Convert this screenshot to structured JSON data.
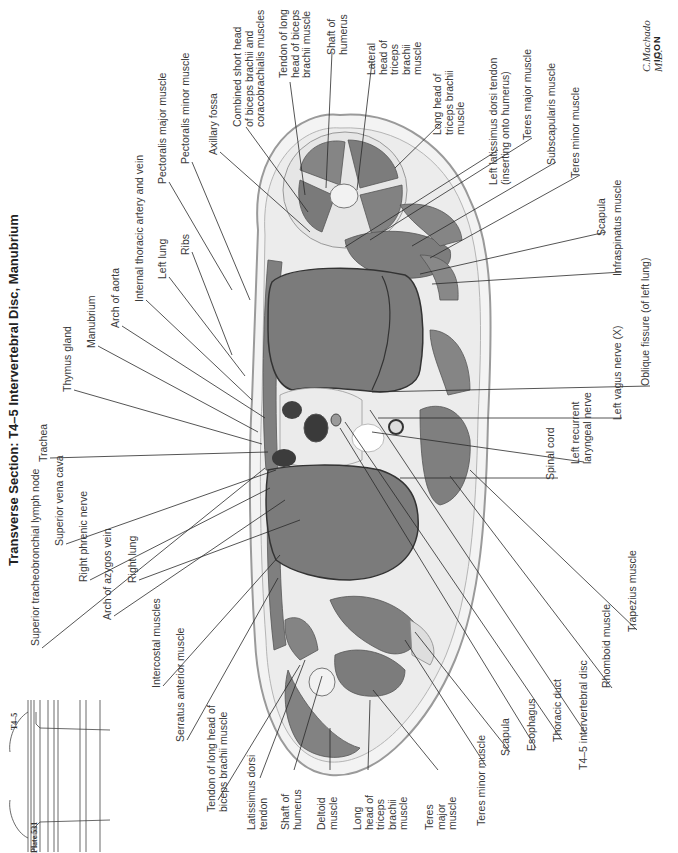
{
  "page": {
    "title": "Transverse Section: T4–5 Intervertebral Disc, Manubrium",
    "plate_number": "Plate 531",
    "level_marker": "T4–5",
    "signature": "C.Machado M.D.",
    "logo": "ICON"
  },
  "labels_left": [
    {
      "id": "trachea",
      "text": "Trachea",
      "x": 38,
      "y": 462
    },
    {
      "id": "thymus-gland",
      "text": "Thymus gland",
      "x": 62,
      "y": 392
    },
    {
      "id": "manubrium",
      "text": "Manubrium",
      "x": 86,
      "y": 348
    },
    {
      "id": "arch-of-aorta",
      "text": "Arch of aorta",
      "x": 110,
      "y": 328
    },
    {
      "id": "internal-thoracic-artery-and-vein",
      "text": "Internal thoracic artery and vein",
      "x": 134,
      "y": 302
    },
    {
      "id": "left-lung",
      "text": "Left lung",
      "x": 157,
      "y": 279
    },
    {
      "id": "ribs",
      "text": "Ribs",
      "x": 180,
      "y": 255
    },
    {
      "id": "pectoralis-major-muscle",
      "text": "Pectoralis major muscle",
      "x": 157,
      "y": 184
    },
    {
      "id": "pectoralis-minor-muscle",
      "text": "Pectoralis minor muscle",
      "x": 180,
      "y": 164
    },
    {
      "id": "axillary-fossa",
      "text": "Axillary fossa",
      "x": 208,
      "y": 155
    },
    {
      "id": "combined-short-head",
      "text": "Combined short head\nof biceps brachii and\ncoracobrachialis muscles",
      "x": 232,
      "y": 127
    },
    {
      "id": "tendon-long-head-biceps-top",
      "text": "Tendon of long\nhead of biceps\nbrachii muscle",
      "x": 278,
      "y": 78
    },
    {
      "id": "shaft-of-humerus-top",
      "text": "Shaft of\nhumerus",
      "x": 326,
      "y": 55
    },
    {
      "id": "lateral-head-triceps",
      "text": "Lateral\nhead of\ntriceps\nbrachii\nmuscle",
      "x": 366,
      "y": 75
    },
    {
      "id": "long-head-triceps-top",
      "text": "Long head of\ntriceps brachii\nmuscle",
      "x": 432,
      "y": 135
    },
    {
      "id": "left-latissimus-dorsi-tendon",
      "text": "Left latissimus dorsi tendon\n(inserting onto humerus)",
      "x": 488,
      "y": 185
    },
    {
      "id": "teres-major-muscle-top",
      "text": "Teres major muscle",
      "x": 522,
      "y": 140
    },
    {
      "id": "subscapularis-muscle",
      "text": "Subscapularis muscle",
      "x": 546,
      "y": 165
    },
    {
      "id": "teres-minor-muscle-top",
      "text": "Teres minor muscle",
      "x": 570,
      "y": 178
    },
    {
      "id": "scapula-top",
      "text": "Scapula",
      "x": 596,
      "y": 236
    },
    {
      "id": "infraspinatus-muscle",
      "text": "Infraspinatus muscle",
      "x": 612,
      "y": 276
    },
    {
      "id": "oblique-fissure",
      "text": "Oblique fissure (of left lung)",
      "x": 640,
      "y": 386
    },
    {
      "id": "left-vagus-nerve",
      "text": "Left vagus nerve (X)",
      "x": 612,
      "y": 420
    },
    {
      "id": "left-recurrent-laryngeal-nerve",
      "text": "Left recurrent\nlaryngeal nerve",
      "x": 570,
      "y": 464
    },
    {
      "id": "spinal-cord",
      "text": "Spinal cord",
      "x": 545,
      "y": 480
    }
  ],
  "labels_bottom": [
    {
      "id": "superior-tracheobronchial-lymph-node",
      "text": "Superior tracheobronchial lymph node",
      "x": 30,
      "y": 646
    },
    {
      "id": "superior-vena-cava",
      "text": "Superior vena cava",
      "x": 54,
      "y": 546
    },
    {
      "id": "right-phrenic-nerve",
      "text": "Right phrenic nerve",
      "x": 78,
      "y": 582
    },
    {
      "id": "arch-of-azygos-vein",
      "text": "Arch of azygos vein",
      "x": 102,
      "y": 620
    },
    {
      "id": "right-lung",
      "text": "Right lung",
      "x": 127,
      "y": 583
    },
    {
      "id": "intercostal-muscles",
      "text": "Intercostal muscles",
      "x": 151,
      "y": 688
    },
    {
      "id": "serratus-anterior-muscle",
      "text": "Serratus anterior muscle",
      "x": 175,
      "y": 742
    },
    {
      "id": "tendon-long-head-biceps-bottom",
      "text": "Tendon of long head of\nbiceps brachii muscle",
      "x": 206,
      "y": 812
    },
    {
      "id": "latissimus-dorsi-tendon",
      "text": "Latissimus dorsi\ntendon",
      "x": 246,
      "y": 830
    },
    {
      "id": "shaft-of-humerus-bottom",
      "text": "Shaft of\nhumerus",
      "x": 280,
      "y": 830
    },
    {
      "id": "deltoid-muscle",
      "text": "Deltoid\nmuscle",
      "x": 316,
      "y": 830
    },
    {
      "id": "long-head-triceps-bottom",
      "text": "Long\nhead of\ntriceps\nbrachii\nmuscle",
      "x": 352,
      "y": 830
    },
    {
      "id": "teres-major-muscle-bottom",
      "text": "Teres\nmajor\nmuscle",
      "x": 424,
      "y": 830
    },
    {
      "id": "teres-minor-muscle-bottom",
      "text": "Teres minor muscle",
      "x": 476,
      "y": 826
    },
    {
      "id": "scapula-bottom",
      "text": "Scapula",
      "x": 500,
      "y": 756
    },
    {
      "id": "esophagus",
      "text": "Esophagus",
      "x": 526,
      "y": 751
    },
    {
      "id": "thoracic-duct",
      "text": "Thoracic duct",
      "x": 552,
      "y": 742
    },
    {
      "id": "t4-5-intervertebral-disc",
      "text": "T4–5 intervertebral disc",
      "x": 578,
      "y": 770
    },
    {
      "id": "rhomboid-muscle",
      "text": "Rhomboid muscle",
      "x": 601,
      "y": 688
    },
    {
      "id": "trapezius-muscle",
      "text": "Trapezius muscle",
      "x": 627,
      "y": 632
    }
  ],
  "leader_lines": [
    [
      50,
      458,
      268,
      452
    ],
    [
      74,
      390,
      262,
      444
    ],
    [
      98,
      346,
      258,
      432
    ],
    [
      122,
      326,
      265,
      418
    ],
    [
      146,
      300,
      252,
      400
    ],
    [
      169,
      277,
      245,
      376
    ],
    [
      192,
      252,
      232,
      355
    ],
    [
      169,
      182,
      232,
      290
    ],
    [
      192,
      162,
      250,
      300
    ],
    [
      220,
      152,
      310,
      232
    ],
    [
      246,
      127,
      308,
      212
    ],
    [
      290,
      82,
      305,
      195
    ],
    [
      332,
      52,
      326,
      188
    ],
    [
      372,
      62,
      357,
      190
    ],
    [
      442,
      122,
      395,
      168
    ],
    [
      498,
      150,
      345,
      247
    ],
    [
      532,
      138,
      370,
      240
    ],
    [
      556,
      162,
      412,
      246
    ],
    [
      580,
      175,
      430,
      258
    ],
    [
      606,
      232,
      420,
      274
    ],
    [
      622,
      272,
      432,
      284
    ],
    [
      650,
      386,
      372,
      392
    ],
    [
      622,
      418,
      378,
      418
    ],
    [
      584,
      462,
      372,
      432
    ],
    [
      558,
      478,
      400,
      478
    ],
    [
      42,
      648,
      265,
      468
    ],
    [
      66,
      544,
      276,
      470
    ],
    [
      90,
      580,
      270,
      488
    ],
    [
      114,
      616,
      285,
      500
    ],
    [
      139,
      580,
      300,
      520
    ],
    [
      163,
      686,
      280,
      555
    ],
    [
      187,
      740,
      278,
      578
    ],
    [
      218,
      800,
      300,
      665
    ],
    [
      260,
      778,
      305,
      660
    ],
    [
      294,
      770,
      322,
      676
    ],
    [
      330,
      770,
      330,
      728
    ],
    [
      368,
      770,
      370,
      700
    ],
    [
      438,
      770,
      373,
      690
    ],
    [
      486,
      766,
      405,
      640
    ],
    [
      510,
      752,
      415,
      632
    ],
    [
      536,
      748,
      340,
      428
    ],
    [
      562,
      740,
      345,
      422
    ],
    [
      586,
      734,
      370,
      410
    ],
    [
      612,
      688,
      450,
      476
    ],
    [
      637,
      630,
      470,
      470
    ]
  ],
  "colors": {
    "skin": "#f4f4f4",
    "fat": "#f1f1f1",
    "muscle": "#8a8a8a",
    "muscle_dark": "#6e6e6e",
    "lung": "#7d7d7d",
    "vessel": "#3b3b3b",
    "bone": "#e8e8e8",
    "line": "#2a2a2a"
  }
}
